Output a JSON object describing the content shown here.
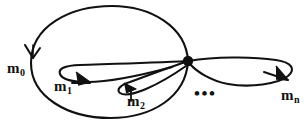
{
  "figure": {
    "kind": "bouquet-of-loops-graph",
    "caption": "",
    "width": 304,
    "height": 129,
    "background_color": "#ffffff",
    "stroke_color": "#111111",
    "vertex": {
      "name": "basepoint-vertex",
      "x": 188,
      "y": 61,
      "radius": 5.2,
      "fill_color": "#111111"
    },
    "ellipsis": {
      "text": "•••",
      "x": 194,
      "y": 85
    },
    "edges": [
      {
        "id": "m0",
        "label": "m",
        "subscript": "0",
        "label_x": 7,
        "label_y": 61,
        "description": "large outer oriented loop enclosing all inner loops",
        "arrow_x": 32,
        "arrow_y": 53,
        "arrow_direction": "down"
      },
      {
        "id": "m1",
        "label": "m",
        "subscript": "1",
        "label_x": 54,
        "label_y": 79,
        "description": "long flattened oriented loop to the left of the vertex",
        "arrow_x": 86,
        "arrow_y": 82,
        "arrow_direction": "right"
      },
      {
        "id": "m2",
        "label": "m",
        "subscript": "2",
        "label_x": 127,
        "label_y": 94,
        "description": "shorter oriented loop below-left of the vertex",
        "arrow_x": 131,
        "arrow_y": 88,
        "arrow_direction": "right"
      },
      {
        "id": "mn",
        "label": "m",
        "subscript": "n",
        "label_x": 281,
        "label_y": 88,
        "description": "oriented loop extending to the right of the vertex",
        "arrow_x": 285,
        "arrow_y": 80,
        "arrow_direction": "right-down"
      }
    ]
  }
}
